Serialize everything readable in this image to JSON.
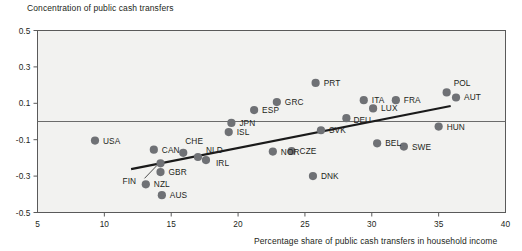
{
  "chart_data": {
    "type": "scatter",
    "title": "Concentration of public cash transfers",
    "xlabel": "Percentage share of public cash transfers in household income",
    "ylabel": "Concentration of public cash transfers",
    "xlim": [
      5,
      40
    ],
    "ylim": [
      -0.5,
      0.5
    ],
    "xticks": [
      "5",
      "10",
      "15",
      "20",
      "25",
      "30",
      "35",
      "40"
    ],
    "xtick_values": [
      5,
      10,
      15,
      20,
      25,
      30,
      35,
      40
    ],
    "yticks": [
      "0.5",
      "0.3",
      "0.1",
      "-0.1",
      "-0.3",
      "-0.5"
    ],
    "ytick_values": [
      0.5,
      0.3,
      0.1,
      -0.1,
      -0.3,
      -0.5
    ],
    "grid": false,
    "zero_line": true,
    "legend": "none",
    "marker_color": "#6f7175",
    "line_color": "#1a1a1a",
    "points": [
      {
        "label": "USA",
        "x": 9.3,
        "y": -0.105,
        "lx": 8,
        "ly": 0
      },
      {
        "label": "NZL",
        "x": 13.1,
        "y": -0.345,
        "lx": 8,
        "ly": 0
      },
      {
        "label": "CAN",
        "x": 13.7,
        "y": -0.155,
        "lx": 8,
        "ly": 0
      },
      {
        "label": "FIN",
        "x": 14.2,
        "y": -0.23,
        "lx": -38,
        "ly": 18,
        "leader": true
      },
      {
        "label": "GBR",
        "x": 14.2,
        "y": -0.278,
        "lx": 8,
        "ly": 0
      },
      {
        "label": "AUS",
        "x": 14.3,
        "y": -0.405,
        "lx": 8,
        "ly": 0
      },
      {
        "label": "CHE",
        "x": 15.9,
        "y": -0.172,
        "lx": 2,
        "ly": -12
      },
      {
        "label": "NLD",
        "x": 17.0,
        "y": -0.195,
        "lx": 8,
        "ly": -7
      },
      {
        "label": "IRL",
        "x": 17.6,
        "y": -0.212,
        "lx": 10,
        "ly": 3
      },
      {
        "label": "ISL",
        "x": 19.3,
        "y": -0.058,
        "lx": 8,
        "ly": 0
      },
      {
        "label": "JPN",
        "x": 19.5,
        "y": -0.008,
        "lx": 8,
        "ly": 0
      },
      {
        "label": "ESP",
        "x": 21.2,
        "y": 0.063,
        "lx": 8,
        "ly": 0
      },
      {
        "label": "NOR",
        "x": 22.6,
        "y": -0.165,
        "lx": 8,
        "ly": 0
      },
      {
        "label": "GRC",
        "x": 22.9,
        "y": 0.107,
        "lx": 8,
        "ly": 0
      },
      {
        "label": "CZE",
        "x": 24.0,
        "y": -0.162,
        "lx": 8,
        "ly": 0
      },
      {
        "label": "DNK",
        "x": 25.6,
        "y": -0.3,
        "lx": 8,
        "ly": 0
      },
      {
        "label": "PRT",
        "x": 25.8,
        "y": 0.212,
        "lx": 8,
        "ly": 0
      },
      {
        "label": "SVK",
        "x": 26.2,
        "y": -0.048,
        "lx": 8,
        "ly": 0
      },
      {
        "label": "DEU",
        "x": 28.1,
        "y": 0.018,
        "lx": 7,
        "ly": 2
      },
      {
        "label": "ITA",
        "x": 29.4,
        "y": 0.117,
        "lx": 8,
        "ly": 0
      },
      {
        "label": "LUX",
        "x": 30.1,
        "y": 0.072,
        "lx": 8,
        "ly": 0
      },
      {
        "label": "BEL",
        "x": 30.4,
        "y": -0.12,
        "lx": 8,
        "ly": 0
      },
      {
        "label": "FRA",
        "x": 31.8,
        "y": 0.117,
        "lx": 8,
        "ly": 0
      },
      {
        "label": "SWE",
        "x": 32.4,
        "y": -0.138,
        "lx": 8,
        "ly": 0
      },
      {
        "label": "HUN",
        "x": 35.0,
        "y": -0.028,
        "lx": 8,
        "ly": 0
      },
      {
        "label": "POL",
        "x": 35.6,
        "y": 0.16,
        "lx": 7,
        "ly": -9
      },
      {
        "label": "AUT",
        "x": 36.3,
        "y": 0.132,
        "lx": 8,
        "ly": 0
      }
    ],
    "trendline": {
      "x0": 12.0,
      "y0": -0.262,
      "x1": 35.9,
      "y1": 0.085
    }
  }
}
